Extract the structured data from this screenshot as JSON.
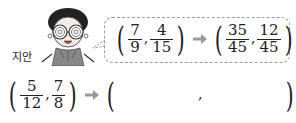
{
  "speaker": {
    "name": "지안"
  },
  "example": {
    "left": {
      "a": {
        "num": "7",
        "den": "9"
      },
      "b": {
        "num": "4",
        "den": "15"
      }
    },
    "right": {
      "a": {
        "num": "35",
        "den": "45"
      },
      "b": {
        "num": "12",
        "den": "45"
      }
    },
    "separator": ","
  },
  "problem": {
    "left": {
      "a": {
        "num": "5",
        "den": "12"
      },
      "b": {
        "num": "7",
        "den": "8"
      }
    },
    "separator": ",",
    "answer_a": "",
    "answer_b": ""
  },
  "colors": {
    "arrow": "#9a9a9a",
    "bubble_border": "#9a9a9a"
  }
}
